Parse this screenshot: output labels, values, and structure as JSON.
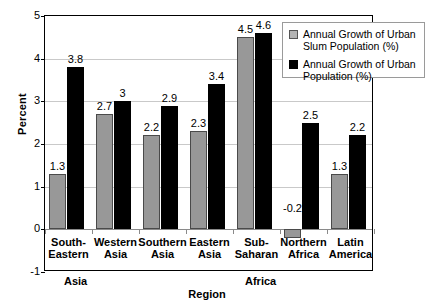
{
  "chart_data": {
    "type": "bar",
    "title": "",
    "xlabel": "Region",
    "ylabel": "Percent",
    "ylim": [
      -1,
      5
    ],
    "yticks": [
      5,
      4,
      3,
      2,
      1,
      0,
      -1
    ],
    "grid": true,
    "legend_position": "top-right",
    "categories": [
      "South-\nEastern",
      "Western\nAsia",
      "Southern\nAsia",
      "Eastern\nAsia",
      "Sub-\nSaharan",
      "Northern\nAfrica",
      "Latin\nAmerica"
    ],
    "category_lines": [
      [
        "South-",
        "Eastern"
      ],
      [
        "Western",
        "Asia"
      ],
      [
        "Southern",
        "Asia"
      ],
      [
        "Eastern",
        "Asia"
      ],
      [
        "Sub-",
        "Saharan"
      ],
      [
        "Northern",
        "Africa"
      ],
      [
        "Latin",
        "America"
      ]
    ],
    "super_groups": [
      {
        "label": "Asia",
        "left_px": 64
      },
      {
        "label": "Africa",
        "left_px": 245
      }
    ],
    "series": [
      {
        "name": "Annual Growth of Urban Slum Population (%)",
        "color": "#989898",
        "values": [
          1.3,
          2.7,
          2.2,
          2.3,
          4.5,
          -0.2,
          1.3
        ],
        "labels": [
          "1.3",
          "2.7",
          "2.2",
          "2.3",
          "4.5",
          "-0.2",
          "1.3"
        ]
      },
      {
        "name": "Annual Growth of Urban Population (%)",
        "color": "#000000",
        "values": [
          3.8,
          3.0,
          2.9,
          3.4,
          4.6,
          2.5,
          2.2
        ],
        "labels": [
          "3.8",
          "3",
          "2.9",
          "3.4",
          "4.6",
          "2.5",
          "2.2"
        ]
      }
    ]
  },
  "legend": {
    "items": [
      {
        "label": "Annual Growth of Urban Slum Population (%)",
        "swatch": "slum"
      },
      {
        "label": "Annual Growth of Urban Population (%)",
        "swatch": "urban"
      }
    ]
  },
  "colors": {
    "slum_bar": "#989898",
    "urban_bar": "#000000",
    "gridline": "#c9c9c9",
    "frame": "#000000",
    "background": "#ffffff"
  }
}
